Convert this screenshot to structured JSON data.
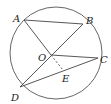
{
  "diagram": {
    "type": "circle-geometry",
    "circle": {
      "center_label": "O"
    },
    "points": [
      {
        "label": "A",
        "x": 24,
        "y": 20,
        "lx": 13,
        "ly": 22
      },
      {
        "label": "B",
        "x": 83,
        "y": 24,
        "lx": 86,
        "ly": 24
      },
      {
        "label": "O",
        "x": 51,
        "y": 55,
        "lx": 38,
        "ly": 61
      },
      {
        "label": "C",
        "x": 98,
        "y": 58,
        "lx": 100,
        "ly": 63
      },
      {
        "label": "D",
        "x": 20,
        "y": 87,
        "lx": 11,
        "ly": 101
      },
      {
        "label": "E",
        "x": 63,
        "y": 70,
        "lx": 62,
        "ly": 82
      }
    ],
    "segments": [
      "AB",
      "AO",
      "BD",
      "OC",
      "DC"
    ],
    "dashed_segments": [
      "OE"
    ]
  }
}
